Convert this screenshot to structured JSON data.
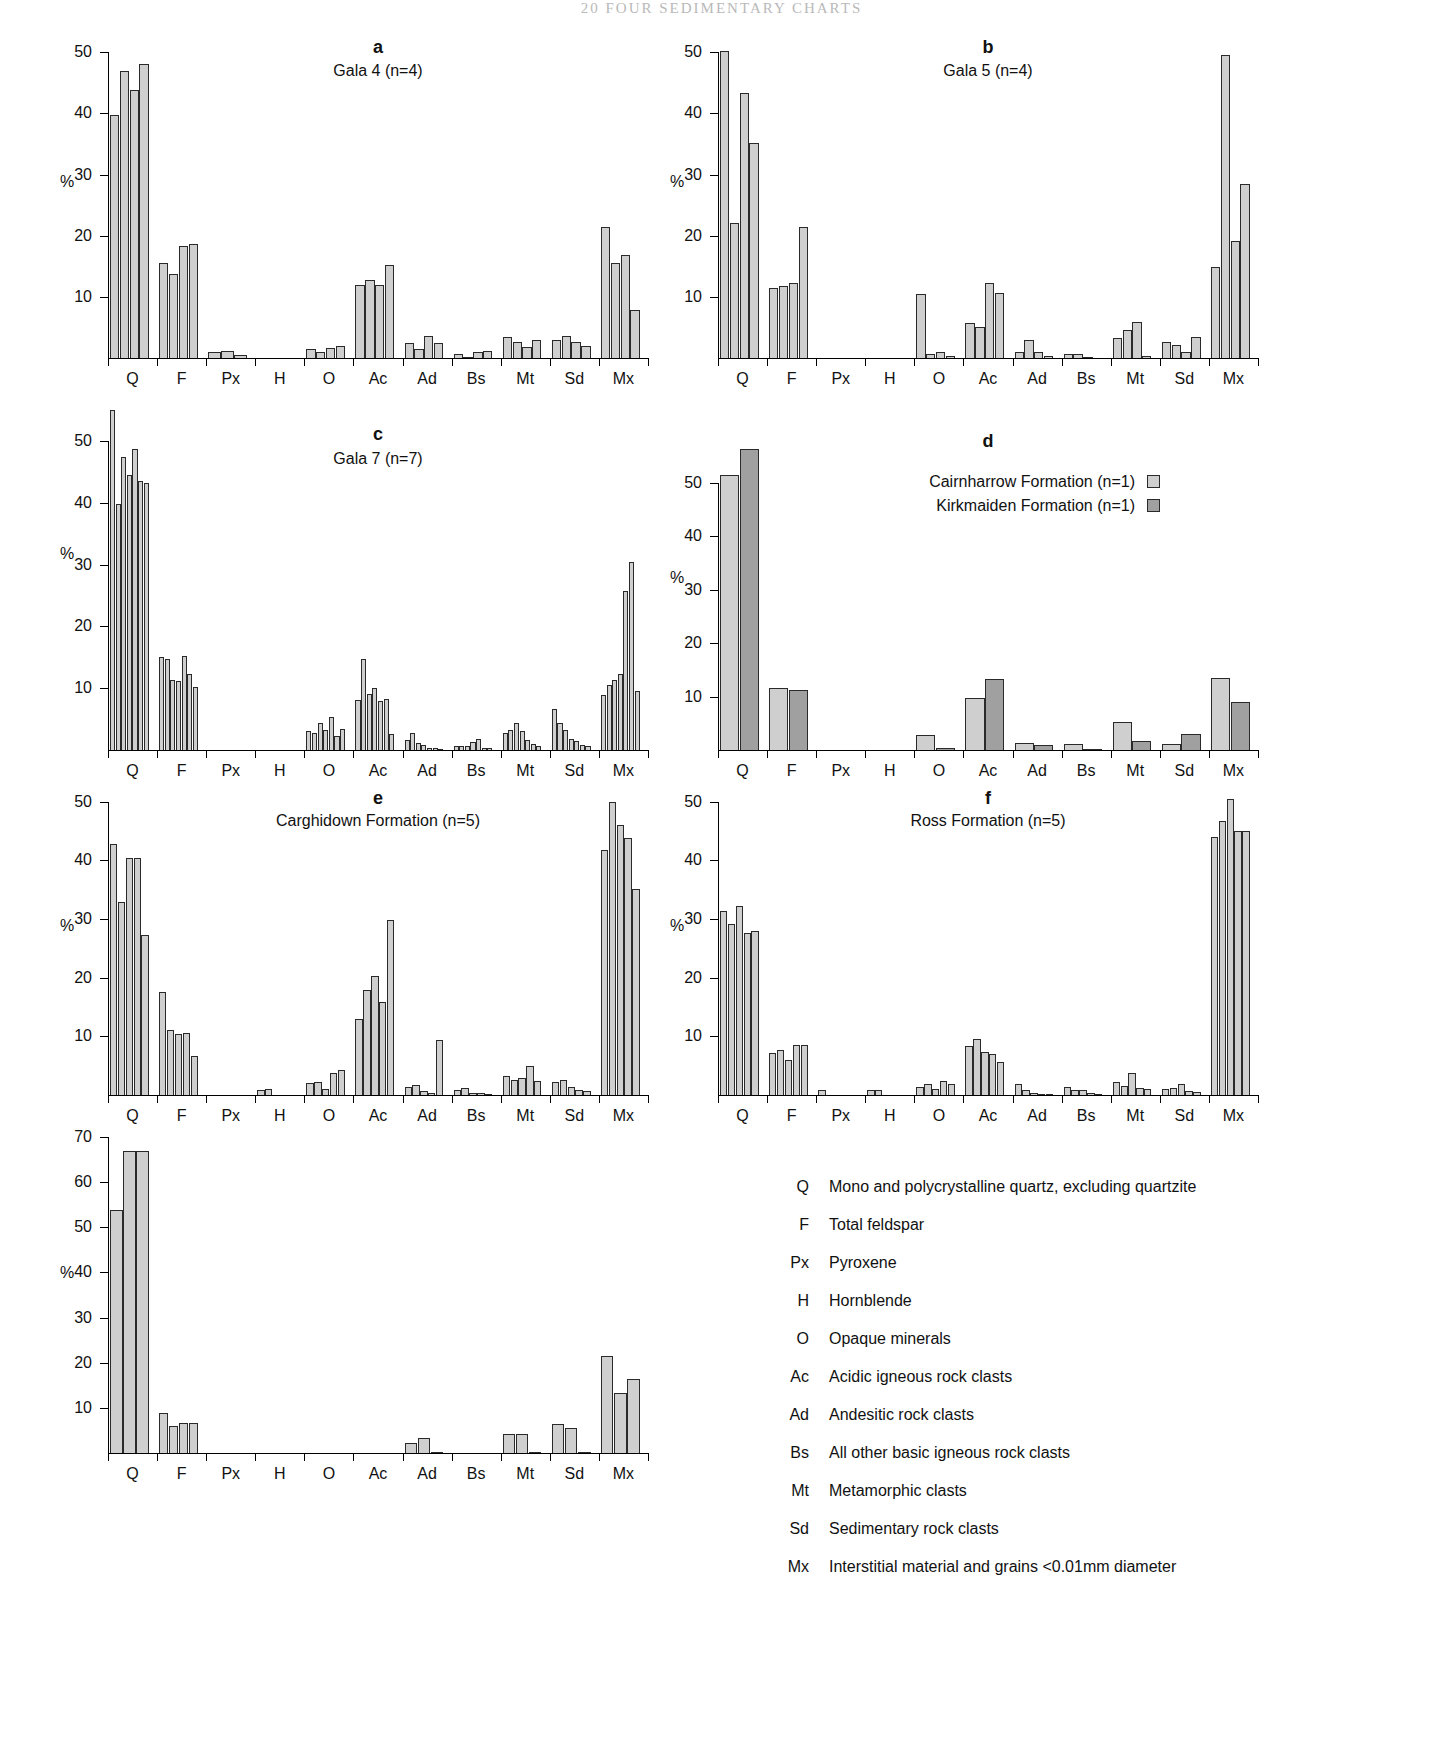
{
  "page_header": "20  FOUR  SEDIMENTARY CHARTS",
  "axis": {
    "percent_label": "%",
    "categories": [
      "Q",
      "F",
      "Px",
      "H",
      "O",
      "Ac",
      "Ad",
      "Bs",
      "Mt",
      "Sd",
      "Mx"
    ]
  },
  "legend_d": {
    "rows": [
      {
        "label": "Cairnharrow Formation (n=1)",
        "swatch": "light"
      },
      {
        "label": "Kirkmaiden Formation (n=1)",
        "swatch": "dark"
      }
    ]
  },
  "key": {
    "items": [
      {
        "abbr": "Q",
        "desc": "Mono and polycrystalline quartz, excluding quartzite"
      },
      {
        "abbr": "F",
        "desc": "Total feldspar"
      },
      {
        "abbr": "Px",
        "desc": "Pyroxene"
      },
      {
        "abbr": "H",
        "desc": "Hornblende"
      },
      {
        "abbr": "O",
        "desc": "Opaque minerals"
      },
      {
        "abbr": "Ac",
        "desc": "Acidic igneous rock clasts"
      },
      {
        "abbr": "Ad",
        "desc": "Andesitic rock clasts"
      },
      {
        "abbr": "Bs",
        "desc": "All other basic igneous rock clasts"
      },
      {
        "abbr": "Mt",
        "desc": "Metamorphic clasts"
      },
      {
        "abbr": "Sd",
        "desc": "Sedimentary rock clasts"
      },
      {
        "abbr": "Mx",
        "desc": "Interstitial material and grains <0.01mm diameter"
      }
    ]
  },
  "colors": {
    "bar_light": "#cfcfcf",
    "bar_dark": "#a0a0a0",
    "bar_edge": "#2a2a2a",
    "axis": "#000000"
  },
  "chart_data": [
    {
      "id": "a",
      "type": "bar",
      "panel_letter": "a",
      "title": "Gala 4 (n=4)",
      "ylabel": "%",
      "xlabel": "",
      "ylim": [
        0,
        52
      ],
      "yticks": [
        10,
        20,
        30,
        40,
        50
      ],
      "grid": false,
      "categories": [
        "Q",
        "F",
        "Px",
        "H",
        "O",
        "Ac",
        "Ad",
        "Bs",
        "Mt",
        "Sd",
        "Mx"
      ],
      "groups": [
        {
          "category": "Q",
          "values": [
            39.8,
            47.0,
            43.8,
            48.0
          ]
        },
        {
          "category": "F",
          "values": [
            15.6,
            13.8,
            18.3,
            18.6
          ]
        },
        {
          "category": "Px",
          "values": [
            1.0,
            1.1,
            0.5
          ]
        },
        {
          "category": "H",
          "values": [
            0,
            0,
            0,
            0
          ]
        },
        {
          "category": "O",
          "values": [
            1.4,
            1.0,
            1.7,
            1.9
          ]
        },
        {
          "category": "Ac",
          "values": [
            11.9,
            12.8,
            11.9,
            15.2
          ]
        },
        {
          "category": "Ad",
          "values": [
            2.4,
            1.5,
            3.6,
            2.4
          ]
        },
        {
          "category": "Bs",
          "values": [
            0.6,
            0.2,
            0.9,
            1.1
          ]
        },
        {
          "category": "Mt",
          "values": [
            3.4,
            2.6,
            1.8,
            3.0
          ]
        },
        {
          "category": "Sd",
          "values": [
            2.9,
            3.6,
            2.6,
            1.9
          ]
        },
        {
          "category": "Mx",
          "values": [
            21.4,
            15.6,
            16.9,
            7.8
          ]
        }
      ]
    },
    {
      "id": "b",
      "type": "bar",
      "panel_letter": "b",
      "title": "Gala 5 (n=4)",
      "ylabel": "%",
      "xlabel": "",
      "ylim": [
        0,
        52
      ],
      "yticks": [
        10,
        20,
        30,
        40,
        50
      ],
      "grid": false,
      "categories": [
        "Q",
        "F",
        "Px",
        "H",
        "O",
        "Ac",
        "Ad",
        "Bs",
        "Mt",
        "Sd",
        "Mx"
      ],
      "groups": [
        {
          "category": "Q",
          "values": [
            50.2,
            22.1,
            43.4,
            35.1
          ]
        },
        {
          "category": "F",
          "values": [
            11.4,
            11.8,
            12.3,
            21.4
          ]
        },
        {
          "category": "Px",
          "values": [
            0,
            0,
            0,
            0
          ]
        },
        {
          "category": "H",
          "values": [
            0,
            0,
            0,
            0
          ]
        },
        {
          "category": "O",
          "values": [
            10.5,
            0.7,
            0.9,
            0.4
          ]
        },
        {
          "category": "Ac",
          "values": [
            5.7,
            5.1,
            12.2,
            10.7
          ]
        },
        {
          "category": "Ad",
          "values": [
            0.9,
            2.9,
            1.0,
            0.3
          ]
        },
        {
          "category": "Bs",
          "values": [
            0.7,
            0.7,
            0.2,
            0
          ]
        },
        {
          "category": "Mt",
          "values": [
            3.3,
            4.6,
            5.9,
            0.3
          ]
        },
        {
          "category": "Sd",
          "values": [
            2.6,
            2.1,
            1.0,
            3.4
          ]
        },
        {
          "category": "Mx",
          "values": [
            14.8,
            49.6,
            19.1,
            28.4
          ]
        }
      ]
    },
    {
      "id": "c",
      "type": "bar",
      "panel_letter": "c",
      "title": "Gala 7 (n=7)",
      "ylabel": "%",
      "xlabel": "",
      "ylim": [
        0,
        57
      ],
      "yticks": [
        10,
        20,
        30,
        40,
        50
      ],
      "grid": false,
      "categories": [
        "Q",
        "F",
        "Px",
        "H",
        "O",
        "Ac",
        "Ad",
        "Bs",
        "Mt",
        "Sd",
        "Mx"
      ],
      "groups": [
        {
          "category": "Q",
          "values": [
            55.1,
            39.8,
            47.4,
            44.5,
            48.8,
            43.6,
            43.2
          ]
        },
        {
          "category": "F",
          "values": [
            15.0,
            14.8,
            11.3,
            11.1,
            15.3,
            12.3,
            10.2
          ]
        },
        {
          "category": "Px",
          "values": [
            0,
            0,
            0,
            0,
            0,
            0,
            0
          ]
        },
        {
          "category": "H",
          "values": [
            0,
            0,
            0,
            0,
            0,
            0,
            0
          ]
        },
        {
          "category": "O",
          "values": [
            3.0,
            2.8,
            4.4,
            3.2,
            5.3,
            2.3,
            3.4
          ]
        },
        {
          "category": "Ac",
          "values": [
            8.1,
            14.8,
            9.1,
            10.0,
            8.0,
            8.2,
            2.6
          ]
        },
        {
          "category": "Ad",
          "values": [
            1.7,
            2.7,
            1.2,
            0.8,
            0.4,
            0.3,
            0.2
          ]
        },
        {
          "category": "Bs",
          "values": [
            0.7,
            0.7,
            0.6,
            1.3,
            1.8,
            0.3,
            0.3
          ]
        },
        {
          "category": "Mt",
          "values": [
            2.7,
            3.3,
            4.3,
            3.0,
            1.6,
            0.9,
            0.7
          ]
        },
        {
          "category": "Sd",
          "values": [
            6.6,
            4.4,
            3.3,
            1.8,
            1.5,
            0.8,
            0.6
          ]
        },
        {
          "category": "Mx",
          "values": [
            8.9,
            10.6,
            11.4,
            12.3,
            25.8,
            30.5,
            9.5
          ]
        }
      ]
    },
    {
      "id": "d",
      "type": "bar",
      "panel_letter": "d",
      "title": "",
      "ylabel": "%",
      "xlabel": "",
      "ylim": [
        0,
        58
      ],
      "yticks": [
        10,
        20,
        30,
        40,
        50
      ],
      "grid": false,
      "series_names": [
        "Cairnharrow Formation (n=1)",
        "Kirkmaiden Formation (n=1)"
      ],
      "categories": [
        "Q",
        "F",
        "Px",
        "H",
        "O",
        "Ac",
        "Ad",
        "Bs",
        "Mt",
        "Sd",
        "Mx"
      ],
      "groups": [
        {
          "category": "Q",
          "values": [
            51.5,
            56.3
          ]
        },
        {
          "category": "F",
          "values": [
            11.6,
            11.3
          ]
        },
        {
          "category": "Px",
          "values": [
            0,
            0
          ]
        },
        {
          "category": "H",
          "values": [
            0,
            0
          ]
        },
        {
          "category": "O",
          "values": [
            2.9,
            0.3
          ]
        },
        {
          "category": "Ac",
          "values": [
            9.8,
            13.2
          ]
        },
        {
          "category": "Ad",
          "values": [
            1.4,
            1.0
          ]
        },
        {
          "category": "Bs",
          "values": [
            1.2,
            0.2
          ]
        },
        {
          "category": "Mt",
          "values": [
            5.3,
            1.7
          ]
        },
        {
          "category": "Sd",
          "values": [
            1.2,
            3.0
          ]
        },
        {
          "category": "Mx",
          "values": [
            13.5,
            9.0
          ]
        }
      ]
    },
    {
      "id": "e",
      "type": "bar",
      "panel_letter": "e",
      "title": "Carghidown Formation (n=5)",
      "ylabel": "%",
      "xlabel": "",
      "ylim": [
        0,
        52
      ],
      "yticks": [
        10,
        20,
        30,
        40,
        50
      ],
      "grid": false,
      "categories": [
        "Q",
        "F",
        "Px",
        "H",
        "O",
        "Ac",
        "Ad",
        "Bs",
        "Mt",
        "Sd",
        "Mx"
      ],
      "groups": [
        {
          "category": "Q",
          "values": [
            42.8,
            32.9,
            40.4,
            40.4,
            27.2
          ]
        },
        {
          "category": "F",
          "values": [
            17.6,
            11.0,
            10.4,
            10.6,
            6.7
          ]
        },
        {
          "category": "Px",
          "values": [
            0,
            0,
            0,
            0,
            0
          ]
        },
        {
          "category": "H",
          "values": [
            0.9,
            1.0,
            0,
            0,
            0
          ]
        },
        {
          "category": "O",
          "values": [
            2.0,
            2.3,
            1.0,
            3.7,
            4.2
          ]
        },
        {
          "category": "Ac",
          "values": [
            13.0,
            17.9,
            20.3,
            15.8,
            29.8
          ]
        },
        {
          "category": "Ad",
          "values": [
            1.4,
            1.7,
            0.6,
            0.3,
            9.4
          ]
        },
        {
          "category": "Bs",
          "values": [
            0.9,
            1.2,
            0.3,
            0.3,
            0.2
          ]
        },
        {
          "category": "Mt",
          "values": [
            3.2,
            2.6,
            2.9,
            4.9,
            2.4
          ]
        },
        {
          "category": "Sd",
          "values": [
            2.2,
            2.5,
            1.3,
            0.9,
            0.6
          ]
        },
        {
          "category": "Mx",
          "values": [
            41.8,
            50.0,
            46.0,
            43.8,
            35.2
          ]
        }
      ]
    },
    {
      "id": "f",
      "type": "bar",
      "panel_letter": "f",
      "title": "Ross Formation (n=5)",
      "ylabel": "%",
      "xlabel": "",
      "ylim": [
        0,
        52
      ],
      "yticks": [
        10,
        20,
        30,
        40,
        50
      ],
      "grid": false,
      "categories": [
        "Q",
        "F",
        "Px",
        "H",
        "O",
        "Ac",
        "Ad",
        "Bs",
        "Mt",
        "Sd",
        "Mx"
      ],
      "groups": [
        {
          "category": "Q",
          "values": [
            31.3,
            29.2,
            32.2,
            27.6,
            28.0
          ]
        },
        {
          "category": "F",
          "values": [
            7.2,
            7.7,
            5.9,
            8.5,
            8.5
          ]
        },
        {
          "category": "Px",
          "values": [
            0.8,
            0,
            0,
            0,
            0
          ]
        },
        {
          "category": "H",
          "values": [
            0.8,
            0.9,
            0,
            0,
            0
          ]
        },
        {
          "category": "O",
          "values": [
            1.3,
            1.8,
            1.0,
            2.4,
            1.8
          ]
        },
        {
          "category": "Ac",
          "values": [
            8.3,
            9.5,
            7.3,
            7.0,
            5.6
          ]
        },
        {
          "category": "Ad",
          "values": [
            1.8,
            0.8,
            0.3,
            0.2,
            0.2
          ]
        },
        {
          "category": "Bs",
          "values": [
            1.3,
            0.9,
            0.8,
            0.3,
            0.2
          ]
        },
        {
          "category": "Mt",
          "values": [
            2.3,
            1.6,
            3.8,
            1.2,
            1.0
          ]
        },
        {
          "category": "Sd",
          "values": [
            1.0,
            1.2,
            1.8,
            0.6,
            0.5
          ]
        },
        {
          "category": "Mx",
          "values": [
            44.0,
            46.8,
            50.5,
            45.0,
            45.0
          ]
        }
      ]
    },
    {
      "id": "g",
      "type": "bar",
      "panel_letter": "",
      "title": "",
      "ylabel": "%",
      "xlabel": "",
      "ylim": [
        0,
        72
      ],
      "yticks": [
        10,
        20,
        30,
        40,
        50,
        60,
        70
      ],
      "grid": false,
      "categories": [
        "Q",
        "F",
        "Px",
        "H",
        "O",
        "Ac",
        "Ad",
        "Bs",
        "Mt",
        "Sd",
        "Mx"
      ],
      "groups": [
        {
          "category": "Q",
          "values": [
            53.8,
            66.8,
            67.0
          ]
        },
        {
          "category": "F",
          "values": [
            8.8,
            5.9,
            6.7,
            6.6
          ]
        },
        {
          "category": "Px",
          "values": [
            0,
            0,
            0
          ]
        },
        {
          "category": "H",
          "values": [
            0,
            0,
            0
          ]
        },
        {
          "category": "O",
          "values": [
            0,
            0,
            0
          ]
        },
        {
          "category": "Ac",
          "values": [
            0,
            0,
            0
          ]
        },
        {
          "category": "Ad",
          "values": [
            2.2,
            3.3,
            0.2
          ]
        },
        {
          "category": "Bs",
          "values": [
            0,
            0,
            0
          ]
        },
        {
          "category": "Mt",
          "values": [
            4.3,
            4.2,
            0.2
          ]
        },
        {
          "category": "Sd",
          "values": [
            6.5,
            5.6,
            0.3
          ]
        },
        {
          "category": "Mx",
          "values": [
            21.4,
            13.3,
            16.5
          ]
        }
      ]
    }
  ]
}
